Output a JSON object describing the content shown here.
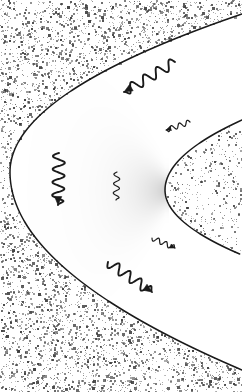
{
  "figure": {
    "name": "bow-shock-parabola-diagram",
    "width": 242,
    "height": 392,
    "background_color": "#ffffff",
    "line_color": "#1a1a1a",
    "stipple_color": "#555555",
    "shade_color": "#b8b8b8"
  },
  "regions": [
    {
      "id": "outer-stippled-region",
      "label": "outer stippled region",
      "fill": "stipple",
      "density": "high"
    },
    {
      "id": "sheath-region",
      "label": "white region between outer and inner curve",
      "fill": "white",
      "density": "none"
    },
    {
      "id": "inner-stippled-region",
      "label": "inner stippled region",
      "fill": "stipple",
      "density": "low"
    },
    {
      "id": "gray-wedge-region",
      "label": "soft gray wedge ahead of inner nose",
      "fill": "gradient-gray",
      "density": "soft"
    }
  ],
  "curves": [
    {
      "id": "outer-boundary",
      "label": "outer parabolic boundary",
      "nose_x": 10,
      "nose_y": 172,
      "exit_top_x": 242,
      "exit_top_y": 14,
      "exit_bottom_x": 242,
      "exit_bottom_y": 370,
      "stroke_width": 1.5
    },
    {
      "id": "inner-boundary",
      "label": "inner parabolic boundary",
      "nose_x": 165,
      "nose_y": 190,
      "exit_top_x": 242,
      "exit_top_y": 120,
      "exit_bottom_x": 242,
      "exit_bottom_y": 255,
      "stroke_width": 1.5
    }
  ],
  "arrows": [
    {
      "id": "wavy-arrow-upper",
      "label": "wavy arrow pointing up-left toward outer boundary",
      "start_x": 175,
      "start_y": 62,
      "end_x": 124,
      "end_y": 92,
      "cycles": 4,
      "amplitude": 5,
      "size": "large",
      "arrowhead": "end"
    },
    {
      "id": "wavy-arrow-left",
      "label": "wavy arrow pointing down-right away from outer nose",
      "start_x": 59,
      "start_y": 153,
      "end_x": 58,
      "end_y": 205,
      "cycles": 4,
      "amplitude": 6,
      "size": "large",
      "arrowhead": "end"
    },
    {
      "id": "wavy-arrow-lower",
      "label": "wavy arrow pointing down-right toward lower outer boundary",
      "start_x": 108,
      "start_y": 262,
      "end_x": 152,
      "end_y": 292,
      "cycles": 4,
      "amplitude": 5,
      "size": "large",
      "arrowhead": "end"
    },
    {
      "id": "wavy-arrow-small-upper-right",
      "label": "small wavy arrow pointing left near inner boundary",
      "start_x": 190,
      "start_y": 122,
      "end_x": 166,
      "end_y": 130,
      "cycles": 3,
      "amplitude": 2.5,
      "size": "small",
      "arrowhead": "end"
    },
    {
      "id": "wavy-arrow-small-lower-right",
      "label": "small wavy arrow pointing down-right near inner boundary",
      "start_x": 152,
      "start_y": 238,
      "end_x": 175,
      "end_y": 248,
      "cycles": 3,
      "amplitude": 2.5,
      "size": "small",
      "arrowhead": "end"
    },
    {
      "id": "wavy-squiggle-center",
      "label": "small vertical squiggle in sheath region with no arrowhead",
      "start_x": 117,
      "start_y": 172,
      "end_x": 116,
      "end_y": 200,
      "cycles": 3,
      "amplitude": 3,
      "size": "small",
      "arrowhead": "none"
    }
  ]
}
